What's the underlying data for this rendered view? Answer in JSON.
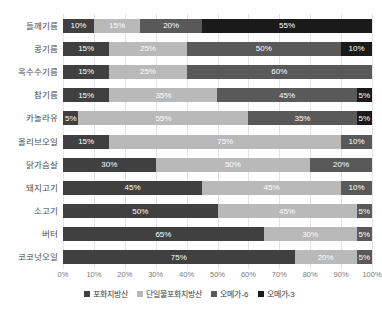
{
  "chart_data": {
    "type": "bar",
    "orientation": "horizontal",
    "stacked": true,
    "stack_total": 100,
    "title": "",
    "xlabel": "",
    "ylabel": "",
    "xlim": [
      0,
      100
    ],
    "xtick_labels": [
      "0%",
      "10%",
      "20%",
      "30%",
      "40%",
      "50%",
      "60%",
      "70%",
      "80%",
      "90%",
      "100%"
    ],
    "xtick_values": [
      0,
      10,
      20,
      30,
      40,
      50,
      60,
      70,
      80,
      90,
      100
    ],
    "grid": true,
    "legend_position": "bottom",
    "categories": [
      "들깨기름",
      "콩기름",
      "옥수수기름",
      "참기름",
      "카놀라유",
      "올리브오일",
      "닭가슴살",
      "돼지고기",
      "소고기",
      "버터",
      "코코넛오일"
    ],
    "series": [
      {
        "name": "포화지방산",
        "color": "#404040",
        "values": [
          10,
          15,
          15,
          15,
          5,
          15,
          30,
          45,
          50,
          65,
          75
        ]
      },
      {
        "name": "단일불포화지방산",
        "color": "#b9b9b9",
        "values": [
          15,
          25,
          25,
          35,
          55,
          75,
          50,
          45,
          45,
          30,
          20
        ]
      },
      {
        "name": "오메가-6",
        "color": "#595959",
        "values": [
          20,
          50,
          60,
          45,
          35,
          10,
          20,
          10,
          5,
          5,
          5
        ]
      },
      {
        "name": "오메가-3",
        "color": "#1a1a1a",
        "values": [
          55,
          10,
          0,
          5,
          5,
          0,
          0,
          0,
          0,
          0,
          0
        ]
      }
    ],
    "bar_labels": [
      [
        "10%",
        "15%",
        "20%",
        "55%"
      ],
      [
        "15%",
        "25%",
        "50%",
        "10%"
      ],
      [
        "15%",
        "25%",
        "60%",
        ""
      ],
      [
        "15%",
        "35%",
        "45%",
        "5%"
      ],
      [
        "5%",
        "55%",
        "35%",
        "5%"
      ],
      [
        "15%",
        "75%",
        "10%",
        ""
      ],
      [
        "30%",
        "50%",
        "20%",
        ""
      ],
      [
        "45%",
        "45%",
        "10%",
        ""
      ],
      [
        "50%",
        "45%",
        "5%",
        ""
      ],
      [
        "65%",
        "30%",
        "5%",
        ""
      ],
      [
        "75%",
        "20%",
        "5%",
        ""
      ]
    ]
  }
}
